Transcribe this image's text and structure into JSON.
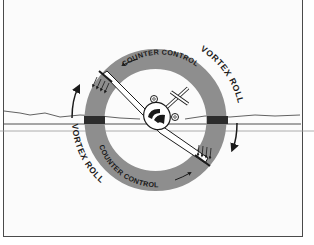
{
  "diagram": {
    "labels": {
      "counter_control_top": "COUNTER CONTROL",
      "counter_control_bottom": "COUNTER CONTROL",
      "vortex_roll_right": "VORTEX ROLL",
      "vortex_roll_left": "VORTEX ROLL"
    },
    "colors": {
      "ring": "#8e8e8e",
      "ring_dark_band": "#2c2c2c",
      "line": "#1a1a1a",
      "horizon": "#3a3a3a",
      "background": "#fbfbfb"
    },
    "elements": [
      {
        "name": "control-ring",
        "description": "gray annulus representing counter control"
      },
      {
        "name": "aircraft",
        "description": "rear view of aircraft banked right wing down"
      },
      {
        "name": "horizon-line",
        "description": "ground / horizon line"
      },
      {
        "name": "vortex-arrows",
        "description": "curved arrows showing roll direction"
      },
      {
        "name": "downwash-arrows",
        "description": "small arrows at wing tips"
      }
    ]
  }
}
